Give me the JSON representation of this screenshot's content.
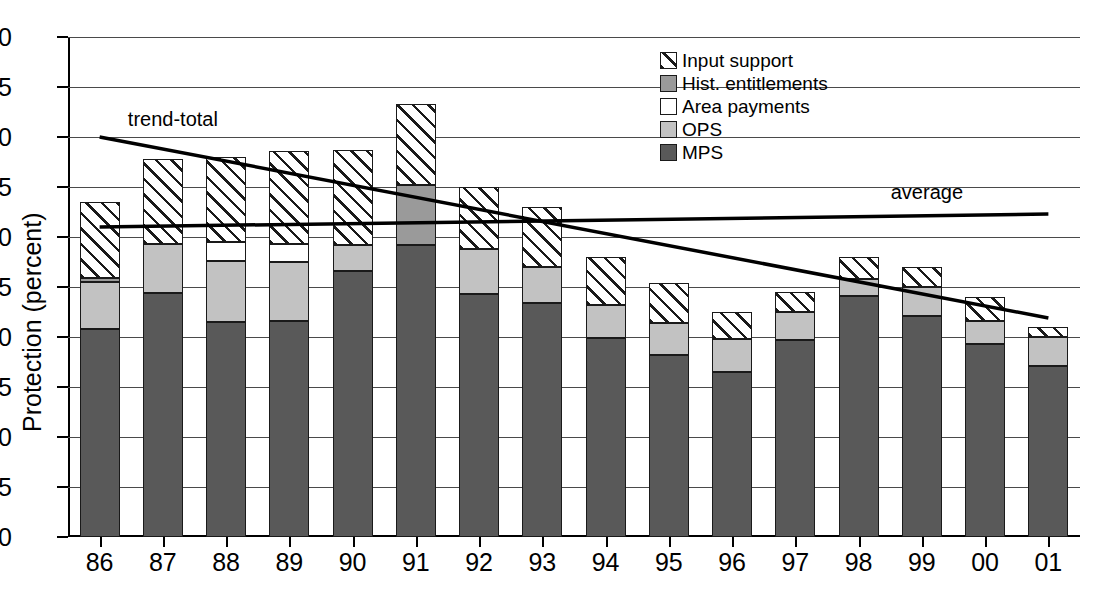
{
  "chart_data": {
    "type": "bar",
    "subtype": "stacked-bar-with-trendlines",
    "title": "",
    "xlabel": "",
    "ylabel": "Protection (percent)",
    "ylim": [
      0,
      50
    ],
    "yticks": [
      0,
      5,
      10,
      15,
      20,
      25,
      30,
      35,
      40,
      45,
      50
    ],
    "grid": true,
    "legend_position": "top-center-right",
    "categories": [
      "86",
      "87",
      "88",
      "89",
      "90",
      "91",
      "92",
      "93",
      "94",
      "95",
      "96",
      "97",
      "98",
      "99",
      "00",
      "01"
    ],
    "series": [
      {
        "name": "MPS",
        "color": "#595959",
        "fill": "solid-dark-gray",
        "values": [
          20.8,
          24.4,
          21.5,
          21.6,
          26.6,
          29.2,
          24.3,
          23.4,
          19.9,
          18.2,
          16.5,
          19.7,
          24.1,
          22.1,
          19.3,
          17.1
        ]
      },
      {
        "name": "OPS",
        "color": "#c2c2c2",
        "fill": "solid-light-gray",
        "values": [
          4.7,
          4.9,
          6.1,
          5.9,
          2.6,
          0.0,
          4.5,
          3.6,
          3.3,
          3.2,
          3.3,
          2.8,
          1.7,
          2.9,
          2.3,
          2.9
        ]
      },
      {
        "name": "Area payments",
        "color": "#ffffff",
        "fill": "white",
        "values": [
          0.0,
          0.0,
          1.9,
          1.8,
          0.0,
          0.0,
          0.0,
          0.0,
          0.0,
          0.0,
          0.0,
          0.0,
          0.0,
          0.0,
          0.0,
          0.0
        ]
      },
      {
        "name": "Hist. entitlements",
        "color": "#9a9a9a",
        "fill": "solid-medium-gray",
        "values": [
          0.4,
          0.0,
          0.0,
          0.0,
          0.0,
          6.0,
          0.0,
          0.0,
          0.0,
          0.0,
          0.0,
          0.0,
          0.0,
          0.0,
          0.0,
          0.0
        ]
      },
      {
        "name": "Input support",
        "color": "#ffffff",
        "fill": "diagonal-hatch",
        "values": [
          7.6,
          8.5,
          8.5,
          9.3,
          9.5,
          8.1,
          6.2,
          6.0,
          4.8,
          4.0,
          2.7,
          2.0,
          2.2,
          2.0,
          2.4,
          1.0
        ]
      }
    ],
    "totals": [
      33.5,
      37.8,
      38.0,
      38.6,
      38.7,
      43.3,
      35.0,
      33.0,
      28.0,
      25.4,
      22.5,
      24.5,
      28.0,
      27.0,
      24.0,
      21.0
    ],
    "annotated_lines": [
      {
        "name": "trend-total",
        "label": "trend-total",
        "x_start": "86",
        "x_end": "01",
        "y_start": 40.0,
        "y_end": 21.9,
        "style": "solid-thick"
      },
      {
        "name": "average",
        "label": "average",
        "x_start": "86",
        "x_end": "01",
        "y_start": 31.0,
        "y_end": 32.3,
        "style": "solid-thick"
      }
    ]
  },
  "axis": {
    "ylabel": "Protection (percent)",
    "yticks": [
      "0",
      "5",
      "10",
      "15",
      "20",
      "25",
      "30",
      "35",
      "40",
      "45",
      "50"
    ],
    "xticks": [
      "86",
      "87",
      "88",
      "89",
      "90",
      "91",
      "92",
      "93",
      "94",
      "95",
      "96",
      "97",
      "98",
      "99",
      "00",
      "01"
    ]
  },
  "legend": {
    "items": [
      {
        "label": "Input support",
        "swatch": "diagonal-hatch"
      },
      {
        "label": "Hist. entitlements",
        "swatch": "medium-gray"
      },
      {
        "label": "Area payments",
        "swatch": "white"
      },
      {
        "label": "OPS",
        "swatch": "light-gray"
      },
      {
        "label": "MPS",
        "swatch": "dark-gray"
      }
    ]
  },
  "annotations": {
    "trend_label": "trend-total",
    "average_label": "average"
  }
}
